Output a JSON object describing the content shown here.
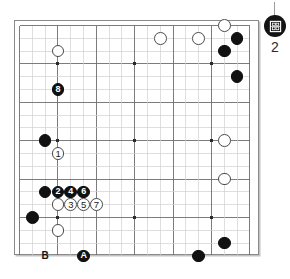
{
  "diagram": {
    "kind": "go-board-diagram",
    "board_size": 19,
    "grid": {
      "cols": 19,
      "rows": 19,
      "origin_x": 5.5,
      "origin_y": 5.5,
      "spacing": 12.8,
      "line_color": "#6e6e6e",
      "light_line_color": "#d0d0d0",
      "border_color": "#8a8a8a"
    },
    "star_points": [
      {
        "col": 3,
        "row": 3
      },
      {
        "col": 9,
        "row": 3
      },
      {
        "col": 15,
        "row": 3
      },
      {
        "col": 3,
        "row": 9
      },
      {
        "col": 9,
        "row": 9
      },
      {
        "col": 15,
        "row": 9
      },
      {
        "col": 3,
        "row": 15
      },
      {
        "col": 9,
        "row": 15
      },
      {
        "col": 15,
        "row": 15
      }
    ],
    "colors": {
      "black_stone": "#111111",
      "white_stone": "#ffffff",
      "white_stone_edge": "#4a4a4a",
      "black_label": "#ffffff",
      "white_label": "#1a1a1a",
      "page_background": "#ffffff"
    },
    "stone_radius": 6.4,
    "stones": [
      {
        "id": "w-c3-top",
        "color": "white",
        "label": "",
        "col": 3,
        "row": 2
      },
      {
        "id": "b-move-8",
        "color": "black",
        "label": "8",
        "col": 3,
        "row": 5
      },
      {
        "id": "w-top-mid-a",
        "color": "white",
        "label": "",
        "col": 11,
        "row": 1
      },
      {
        "id": "w-top-mid-b",
        "color": "white",
        "label": "",
        "col": 14,
        "row": 1
      },
      {
        "id": "w-top-right",
        "color": "white",
        "label": "",
        "col": 16,
        "row": 0
      },
      {
        "id": "b-top-right-1",
        "color": "black",
        "label": "",
        "col": 17,
        "row": 1
      },
      {
        "id": "b-top-right-2",
        "color": "black",
        "label": "",
        "col": 16,
        "row": 2
      },
      {
        "id": "b-right-upper",
        "color": "black",
        "label": "",
        "col": 17,
        "row": 4
      },
      {
        "id": "b-left-star",
        "color": "black",
        "label": "",
        "col": 2,
        "row": 9
      },
      {
        "id": "w-move-1",
        "color": "white",
        "label": "1",
        "col": 3,
        "row": 10
      },
      {
        "id": "w-right-star",
        "color": "white",
        "label": "",
        "col": 16,
        "row": 9
      },
      {
        "id": "b-left-wall",
        "color": "black",
        "label": "",
        "col": 2,
        "row": 13
      },
      {
        "id": "b-move-2",
        "color": "black",
        "label": "2",
        "col": 3,
        "row": 13
      },
      {
        "id": "b-move-4",
        "color": "black",
        "label": "4",
        "col": 4,
        "row": 13
      },
      {
        "id": "b-move-6",
        "color": "black",
        "label": "6",
        "col": 5,
        "row": 13
      },
      {
        "id": "w-under-2",
        "color": "white",
        "label": "",
        "col": 3,
        "row": 14
      },
      {
        "id": "w-move-3",
        "color": "white",
        "label": "3",
        "col": 4,
        "row": 14
      },
      {
        "id": "w-move-5",
        "color": "white",
        "label": "5",
        "col": 5,
        "row": 14
      },
      {
        "id": "w-move-7",
        "color": "white",
        "label": "7",
        "col": 6,
        "row": 14
      },
      {
        "id": "w-right-lower",
        "color": "white",
        "label": "",
        "col": 16,
        "row": 12
      },
      {
        "id": "b-left-low",
        "color": "black",
        "label": "",
        "col": 1,
        "row": 15
      },
      {
        "id": "w-lower-left",
        "color": "white",
        "label": "",
        "col": 3,
        "row": 16
      },
      {
        "id": "b-mark-A",
        "color": "black",
        "label": "A",
        "col": 5,
        "row": 18
      },
      {
        "id": "b-bottom-right",
        "color": "black",
        "label": "",
        "col": 16,
        "row": 17
      },
      {
        "id": "b-bottom-mid",
        "color": "black",
        "label": "",
        "col": 14,
        "row": 18
      }
    ],
    "text_markers": [
      {
        "id": "mark-B",
        "label": "B",
        "col": 2,
        "row": 18
      }
    ]
  },
  "side_widget": {
    "icon_name": "black-stone-diagram-icon",
    "count": "2"
  }
}
